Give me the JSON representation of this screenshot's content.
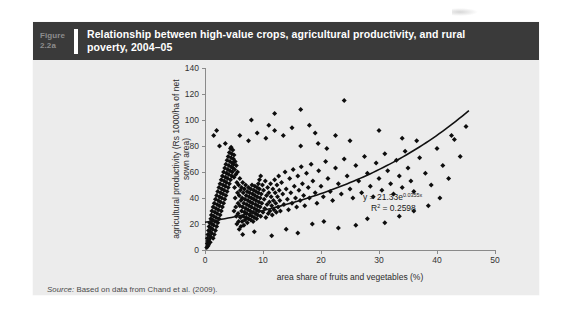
{
  "figure": {
    "number_word": "Figure",
    "number_id": "2.2a",
    "title": "Relationship between high-value crops, agricultural productivity, and rural poverty, 2004–05",
    "source_label": "Source:",
    "source_text": " Based on data from Chand et al. (2009)."
  },
  "colors": {
    "header_bg": "#3a3a3a",
    "panel_bg": "#ececec",
    "figure_number": "#8d8d8d",
    "title": "#ffffff",
    "marker": "#0d0d0d",
    "trend": "#111111",
    "axis": "#8a8a8a"
  },
  "chart_data": {
    "type": "scatter",
    "title": "",
    "xlabel": "area share of fruits and vegetables (%)",
    "ylabel": "agricultural productivity (Rs 1000/ha of net sown area)",
    "xlim": [
      0,
      50
    ],
    "ylim": [
      0,
      140
    ],
    "xticks": [
      0,
      10,
      20,
      30,
      40,
      50
    ],
    "yticks": [
      0,
      20,
      40,
      60,
      80,
      100,
      120,
      140
    ],
    "grid": false,
    "legend": null,
    "annotations": [
      {
        "text_main": "y = 21.33e",
        "text_sup": "0.0355x",
        "text_line2_pre": "R",
        "text_line2_sup": "2",
        "text_line2_post": " = 0.2598"
      }
    ],
    "trendline": {
      "type": "exponential",
      "equation": "y = 21.33e^(0.0355x)",
      "r_squared": 0.2598,
      "coefficient": 21.33,
      "exponent_rate": 0.0355,
      "x_range": [
        0,
        45.5
      ]
    },
    "points": [
      [
        0.3,
        2
      ],
      [
        0.4,
        5
      ],
      [
        0.4,
        9
      ],
      [
        0.5,
        3
      ],
      [
        0.5,
        7
      ],
      [
        0.5,
        12
      ],
      [
        0.6,
        15
      ],
      [
        0.6,
        4
      ],
      [
        0.7,
        18
      ],
      [
        0.7,
        8
      ],
      [
        0.8,
        11
      ],
      [
        0.8,
        21
      ],
      [
        0.9,
        6
      ],
      [
        0.9,
        14
      ],
      [
        1.0,
        24
      ],
      [
        1.0,
        10
      ],
      [
        1.0,
        17
      ],
      [
        1.1,
        27
      ],
      [
        1.1,
        13
      ],
      [
        1.2,
        20
      ],
      [
        1.2,
        30
      ],
      [
        1.3,
        16
      ],
      [
        1.3,
        23
      ],
      [
        1.4,
        33
      ],
      [
        1.4,
        9
      ],
      [
        1.5,
        26
      ],
      [
        1.5,
        19
      ],
      [
        1.6,
        36
      ],
      [
        1.6,
        12
      ],
      [
        1.7,
        29
      ],
      [
        1.7,
        22
      ],
      [
        1.8,
        39
      ],
      [
        1.8,
        15
      ],
      [
        1.9,
        32
      ],
      [
        1.9,
        25
      ],
      [
        2.0,
        42
      ],
      [
        2.0,
        18
      ],
      [
        2.1,
        35
      ],
      [
        2.1,
        28
      ],
      [
        2.2,
        45
      ],
      [
        2.2,
        21
      ],
      [
        2.3,
        38
      ],
      [
        2.3,
        31
      ],
      [
        2.4,
        48
      ],
      [
        2.4,
        24
      ],
      [
        2.5,
        41
      ],
      [
        2.5,
        34
      ],
      [
        2.6,
        51
      ],
      [
        2.6,
        27
      ],
      [
        2.7,
        44
      ],
      [
        2.7,
        37
      ],
      [
        2.8,
        54
      ],
      [
        2.8,
        30
      ],
      [
        2.9,
        47
      ],
      [
        2.9,
        40
      ],
      [
        3.0,
        57
      ],
      [
        3.0,
        33
      ],
      [
        3.1,
        50
      ],
      [
        3.1,
        43
      ],
      [
        3.2,
        60
      ],
      [
        3.2,
        36
      ],
      [
        3.3,
        53
      ],
      [
        3.3,
        46
      ],
      [
        3.4,
        63
      ],
      [
        3.4,
        39
      ],
      [
        3.5,
        56
      ],
      [
        3.5,
        49
      ],
      [
        3.6,
        66
      ],
      [
        3.6,
        42
      ],
      [
        3.7,
        59
      ],
      [
        3.7,
        52
      ],
      [
        3.8,
        69
      ],
      [
        3.8,
        45
      ],
      [
        3.9,
        62
      ],
      [
        3.9,
        55
      ],
      [
        4.0,
        72
      ],
      [
        4.0,
        48
      ],
      [
        4.1,
        65
      ],
      [
        4.1,
        58
      ],
      [
        4.2,
        75
      ],
      [
        4.2,
        51
      ],
      [
        4.3,
        68
      ],
      [
        4.3,
        61
      ],
      [
        4.4,
        78
      ],
      [
        4.4,
        54
      ],
      [
        4.5,
        71
      ],
      [
        4.5,
        64
      ],
      [
        4.6,
        57
      ],
      [
        4.6,
        74
      ],
      [
        4.7,
        67
      ],
      [
        4.7,
        60
      ],
      [
        4.8,
        77
      ],
      [
        4.8,
        63
      ],
      [
        4.9,
        70
      ],
      [
        4.9,
        66
      ],
      [
        5.0,
        73
      ],
      [
        5.0,
        56
      ],
      [
        5.1,
        62
      ],
      [
        5.1,
        48
      ],
      [
        5.2,
        68
      ],
      [
        5.2,
        40
      ],
      [
        5.3,
        58
      ],
      [
        5.3,
        33
      ],
      [
        5.4,
        65
      ],
      [
        5.4,
        26
      ],
      [
        5.5,
        52
      ],
      [
        5.5,
        20
      ],
      [
        5.6,
        60
      ],
      [
        5.6,
        44
      ],
      [
        5.7,
        36
      ],
      [
        5.7,
        28
      ],
      [
        5.8,
        50
      ],
      [
        5.8,
        22
      ],
      [
        5.9,
        42
      ],
      [
        5.9,
        16
      ],
      [
        6.0,
        55
      ],
      [
        6.0,
        34
      ],
      [
        6.1,
        46
      ],
      [
        6.1,
        25
      ],
      [
        6.2,
        38
      ],
      [
        6.2,
        18
      ],
      [
        6.3,
        48
      ],
      [
        6.3,
        30
      ],
      [
        6.4,
        40
      ],
      [
        6.4,
        22
      ],
      [
        6.5,
        52
      ],
      [
        6.5,
        33
      ],
      [
        6.6,
        44
      ],
      [
        6.6,
        26
      ],
      [
        6.7,
        36
      ],
      [
        6.7,
        19
      ],
      [
        6.8,
        47
      ],
      [
        6.8,
        29
      ],
      [
        6.9,
        39
      ],
      [
        6.9,
        23
      ],
      [
        7.0,
        50
      ],
      [
        7.0,
        32
      ],
      [
        7.1,
        42
      ],
      [
        7.1,
        25
      ],
      [
        7.2,
        35
      ],
      [
        7.2,
        28
      ],
      [
        7.3,
        45
      ],
      [
        7.3,
        21
      ],
      [
        7.4,
        38
      ],
      [
        7.4,
        31
      ],
      [
        7.5,
        48
      ],
      [
        7.5,
        24
      ],
      [
        7.6,
        41
      ],
      [
        7.6,
        34
      ],
      [
        7.7,
        27
      ],
      [
        7.7,
        44
      ],
      [
        7.8,
        30
      ],
      [
        7.8,
        37
      ],
      [
        7.9,
        23
      ],
      [
        7.9,
        47
      ],
      [
        8.0,
        33
      ],
      [
        8.0,
        40
      ],
      [
        8.1,
        26
      ],
      [
        8.1,
        50
      ],
      [
        8.2,
        36
      ],
      [
        8.2,
        43
      ],
      [
        8.3,
        29
      ],
      [
        8.3,
        22
      ],
      [
        8.4,
        39
      ],
      [
        8.4,
        46
      ],
      [
        8.5,
        32
      ],
      [
        8.5,
        25
      ],
      [
        8.6,
        42
      ],
      [
        8.6,
        49
      ],
      [
        8.7,
        35
      ],
      [
        8.7,
        28
      ],
      [
        8.8,
        45
      ],
      [
        8.8,
        38
      ],
      [
        8.9,
        31
      ],
      [
        8.9,
        24
      ],
      [
        9.0,
        48
      ],
      [
        9.0,
        41
      ],
      [
        9.1,
        34
      ],
      [
        9.1,
        27
      ],
      [
        9.2,
        51
      ],
      [
        9.2,
        44
      ],
      [
        9.3,
        37
      ],
      [
        9.3,
        30
      ],
      [
        9.4,
        54
      ],
      [
        9.4,
        47
      ],
      [
        9.5,
        40
      ],
      [
        9.5,
        33
      ],
      [
        9.6,
        57
      ],
      [
        9.6,
        26
      ],
      [
        9.7,
        43
      ],
      [
        9.8,
        36
      ],
      [
        9.9,
        50
      ],
      [
        10.0,
        29
      ],
      [
        10.1,
        46
      ],
      [
        10.2,
        39
      ],
      [
        10.3,
        32
      ],
      [
        10.4,
        53
      ],
      [
        10.5,
        25
      ],
      [
        10.6,
        42
      ],
      [
        10.7,
        35
      ],
      [
        10.8,
        48
      ],
      [
        10.9,
        28
      ],
      [
        11.0,
        44
      ],
      [
        11.1,
        37
      ],
      [
        11.2,
        30
      ],
      [
        11.3,
        51
      ],
      [
        11.4,
        41
      ],
      [
        11.5,
        34
      ],
      [
        11.6,
        27
      ],
      [
        11.7,
        47
      ],
      [
        11.8,
        38
      ],
      [
        11.9,
        31
      ],
      [
        12.0,
        54
      ],
      [
        12.1,
        44
      ],
      [
        12.2,
        36
      ],
      [
        12.3,
        29
      ],
      [
        12.4,
        50
      ],
      [
        12.5,
        41
      ],
      [
        12.6,
        33
      ],
      [
        12.7,
        57
      ],
      [
        12.8,
        46
      ],
      [
        12.9,
        38
      ],
      [
        13.0,
        30
      ],
      [
        13.2,
        52
      ],
      [
        13.4,
        43
      ],
      [
        13.6,
        35
      ],
      [
        13.8,
        60
      ],
      [
        14.0,
        47
      ],
      [
        14.2,
        39
      ],
      [
        14.4,
        31
      ],
      [
        14.6,
        55
      ],
      [
        14.8,
        44
      ],
      [
        15.0,
        36
      ],
      [
        15.2,
        62
      ],
      [
        15.4,
        49
      ],
      [
        15.6,
        40
      ],
      [
        15.8,
        33
      ],
      [
        16.0,
        57
      ],
      [
        16.2,
        46
      ],
      [
        16.4,
        38
      ],
      [
        16.6,
        64
      ],
      [
        16.8,
        51
      ],
      [
        17.0,
        42
      ],
      [
        17.2,
        34
      ],
      [
        17.5,
        59
      ],
      [
        17.8,
        48
      ],
      [
        18.0,
        40
      ],
      [
        18.3,
        66
      ],
      [
        18.6,
        53
      ],
      [
        19.0,
        44
      ],
      [
        19.3,
        36
      ],
      [
        19.6,
        61
      ],
      [
        20.0,
        49
      ],
      [
        20.4,
        41
      ],
      [
        20.8,
        68
      ],
      [
        21.2,
        55
      ],
      [
        21.6,
        45
      ],
      [
        22.0,
        38
      ],
      [
        22.5,
        63
      ],
      [
        23.0,
        51
      ],
      [
        23.5,
        43
      ],
      [
        24.0,
        70
      ],
      [
        24.5,
        57
      ],
      [
        25.0,
        47
      ],
      [
        25.5,
        40
      ],
      [
        26.0,
        65
      ],
      [
        26.5,
        53
      ],
      [
        27.0,
        44
      ],
      [
        27.5,
        72
      ],
      [
        28.0,
        59
      ],
      [
        28.5,
        49
      ],
      [
        29.0,
        41
      ],
      [
        29.5,
        67
      ],
      [
        30.0,
        55
      ],
      [
        30.5,
        46
      ],
      [
        31.0,
        74
      ],
      [
        31.5,
        61
      ],
      [
        32.0,
        51
      ],
      [
        32.5,
        43
      ],
      [
        33.0,
        69
      ],
      [
        33.5,
        57
      ],
      [
        34.0,
        48
      ],
      [
        34.5,
        76
      ],
      [
        35.0,
        63
      ],
      [
        35.5,
        53
      ],
      [
        36.0,
        45
      ],
      [
        37.0,
        71
      ],
      [
        38.0,
        59
      ],
      [
        39.0,
        50
      ],
      [
        40.0,
        78
      ],
      [
        41.0,
        65
      ],
      [
        42.0,
        55
      ],
      [
        43.0,
        85
      ],
      [
        44.0,
        72
      ],
      [
        45.0,
        95
      ],
      [
        2.5,
        80
      ],
      [
        3.5,
        82
      ],
      [
        4.5,
        79
      ],
      [
        6.0,
        88
      ],
      [
        7.5,
        84
      ],
      [
        9.0,
        90
      ],
      [
        10.5,
        86
      ],
      [
        12.0,
        92
      ],
      [
        13.5,
        88
      ],
      [
        15.0,
        94
      ],
      [
        16.5,
        80
      ],
      [
        18.0,
        96
      ],
      [
        19.5,
        82
      ],
      [
        21.0,
        78
      ],
      [
        22.5,
        88
      ],
      [
        25.0,
        84
      ],
      [
        12.0,
        105
      ],
      [
        16.5,
        108
      ],
      [
        19.0,
        90
      ],
      [
        24.0,
        115
      ],
      [
        30.0,
        92
      ],
      [
        34.0,
        86
      ],
      [
        36.5,
        84
      ],
      [
        42.5,
        88
      ],
      [
        1.5,
        88
      ],
      [
        2.0,
        92
      ],
      [
        8.0,
        100
      ],
      [
        11.0,
        96
      ],
      [
        5.0,
        30
      ],
      [
        6.5,
        12
      ],
      [
        8.5,
        14
      ],
      [
        11.5,
        11
      ],
      [
        14.0,
        16
      ],
      [
        16.0,
        13
      ],
      [
        18.5,
        20
      ],
      [
        20.5,
        22
      ],
      [
        23.0,
        17
      ],
      [
        26.0,
        19
      ],
      [
        28.0,
        24
      ],
      [
        31.0,
        21
      ],
      [
        33.5,
        26
      ],
      [
        36.0,
        30
      ],
      [
        38.5,
        34
      ],
      [
        40.5,
        40
      ]
    ],
    "point_count_note": "dense overlapping cluster near origin"
  }
}
